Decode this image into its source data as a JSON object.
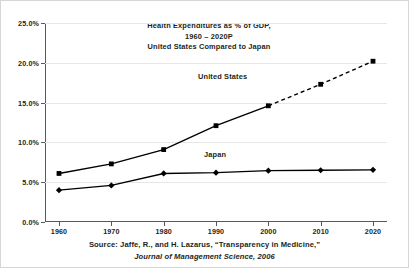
{
  "chart_data": {
    "type": "line",
    "title": "Health Expenditures as % of GDP,\n1960 – 2020P\nUnited States Compared to Japan",
    "title_lines": [
      "Health Expenditures as % of GDP,",
      "1960 – 2020P",
      "United States Compared to Japan"
    ],
    "xlabel": "",
    "ylabel": "",
    "x": [
      1960,
      1970,
      1980,
      1990,
      2000,
      2010,
      2020
    ],
    "categories": [
      "1960",
      "1970",
      "1980",
      "1990",
      "2000",
      "2010",
      "2020"
    ],
    "xtick_labels": [
      "1960",
      "1970",
      "1980",
      "1990",
      "2000",
      "2010",
      "2020"
    ],
    "ytick_labels": [
      "0.0%",
      "5.0%",
      "10.0%",
      "15.0%",
      "20.0%",
      "25.0%"
    ],
    "ytick_values": [
      0.0,
      5.0,
      10.0,
      15.0,
      20.0,
      25.0
    ],
    "ylim": [
      0.0,
      25.0
    ],
    "xlim": [
      1960,
      2020
    ],
    "grid": "horizontal",
    "legend_position": "inline-annotations",
    "series": [
      {
        "name": "United States",
        "values": [
          6.1,
          7.3,
          9.1,
          12.1,
          14.6,
          17.3,
          20.2
        ],
        "marker": "square",
        "color": "#000000",
        "solid_through": 2000,
        "projection_style": "dashed",
        "projection_from": 2000
      },
      {
        "name": "Japan",
        "values": [
          4.0,
          4.6,
          6.1,
          6.2,
          6.45,
          6.5,
          6.55
        ],
        "marker": "diamond",
        "color": "#000000",
        "projection_style": "none"
      }
    ],
    "annotations": [
      {
        "text": "United States",
        "x": 1990,
        "y": 17.0
      },
      {
        "text": "Japan",
        "x": 1993,
        "y": 8.6
      }
    ],
    "source_lines": [
      "Source: Jaffe, R., and H. Lazarus, “Transparency in Medicine,”",
      "Journal of Management Science, 2006"
    ],
    "colors": {
      "line": "#000000",
      "grid": "#e6e7e8",
      "axis": "#58595b",
      "text": "#231f20",
      "background": "#ffffff",
      "border": "#d7d7d7"
    }
  }
}
